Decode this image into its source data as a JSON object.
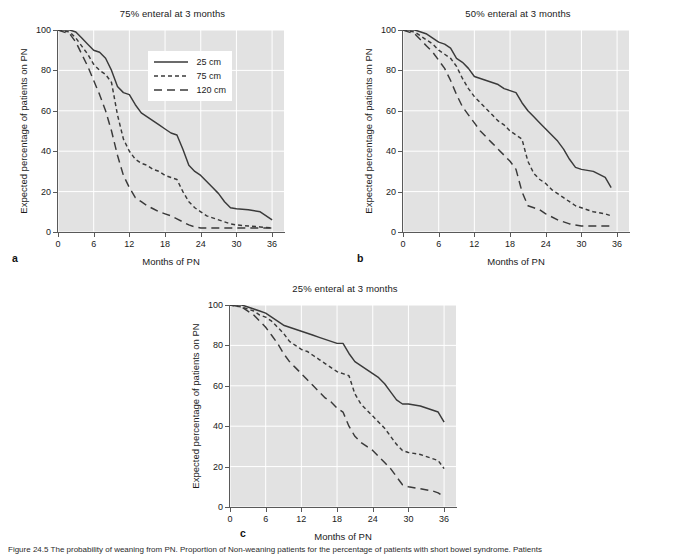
{
  "figure": {
    "caption_prefix": "Figure",
    "caption_text": "Figure 24.5  The probability of weaning from PN. Proportion of Non-weaning patients for the percentage of patients with short bowel syndrome. Patients"
  },
  "axis": {
    "xlabel": "Months of PN",
    "ylabel": "Expected percentage of patients on PN",
    "xticks": [
      0,
      6,
      12,
      18,
      24,
      30,
      36
    ],
    "yticks": [
      0,
      20,
      40,
      60,
      80,
      100
    ],
    "xlim": [
      0,
      38
    ],
    "ylim": [
      0,
      100
    ]
  },
  "legend": {
    "position": "upper-right-inside-panel-a",
    "entries": [
      {
        "label": "25 cm",
        "dash": "solid"
      },
      {
        "label": "75 cm",
        "dash": "short"
      },
      {
        "label": "120 cm",
        "dash": "long"
      }
    ]
  },
  "panels": [
    {
      "letter": "a",
      "title": "75% enteral at 3 months"
    },
    {
      "letter": "b",
      "title": "50% enteral at 3 months"
    },
    {
      "letter": "c",
      "title": "25% enteral at 3 months"
    }
  ],
  "colors": {
    "plot_background": "#e2e2e2",
    "gridline": "#ffffff",
    "axis": "#595959",
    "curve": "#3a3a3a",
    "page_background": "#ffffff",
    "text": "#1a1a1a"
  },
  "chart_data": [
    {
      "type": "line",
      "panel": "a",
      "title": "75% enteral at 3 months",
      "xlabel": "Months of PN",
      "ylabel": "Expected percentage of patients on PN",
      "xlim": [
        0,
        38
      ],
      "ylim": [
        0,
        100
      ],
      "grid": true,
      "legend": [
        "25 cm",
        "75 cm",
        "120 cm"
      ],
      "series": [
        {
          "name": "25 cm",
          "dash": "solid",
          "x": [
            0,
            2,
            3,
            4,
            5,
            6,
            7,
            8,
            9,
            10,
            11,
            12,
            13,
            14,
            15,
            16,
            17,
            18,
            19,
            20,
            21,
            22,
            23,
            24,
            25,
            26,
            27,
            28,
            29,
            30,
            32,
            34,
            36
          ],
          "y": [
            100,
            100,
            99,
            96,
            93,
            90,
            89,
            86,
            80,
            72,
            69,
            68,
            63,
            59,
            57,
            55,
            53,
            51,
            49,
            48,
            41,
            33,
            30,
            28,
            25,
            22,
            19,
            15,
            12,
            11.5,
            11,
            10,
            6
          ]
        },
        {
          "name": "75 cm",
          "dash": "short",
          "x": [
            0,
            2,
            3,
            4,
            5,
            6,
            7,
            8,
            9,
            10,
            11,
            12,
            13,
            14,
            15,
            16,
            17,
            18,
            19,
            20,
            21,
            22,
            23,
            24,
            25,
            26,
            27,
            28,
            29,
            30,
            32,
            34,
            36
          ],
          "y": [
            100,
            99,
            96,
            92,
            88,
            83,
            80,
            78,
            74,
            58,
            46,
            40,
            36,
            34,
            33,
            31,
            30,
            28,
            27,
            26,
            20,
            15,
            12,
            10,
            8,
            7,
            6,
            5,
            4,
            3.5,
            3,
            2.5,
            2
          ]
        },
        {
          "name": "120 cm",
          "dash": "long",
          "x": [
            0,
            2,
            3,
            4,
            5,
            6,
            7,
            8,
            9,
            10,
            11,
            12,
            13,
            14,
            15,
            16,
            17,
            18,
            19,
            20,
            21,
            22,
            23,
            24,
            26,
            28,
            30,
            32,
            34,
            36
          ],
          "y": [
            100,
            98,
            94,
            88,
            82,
            75,
            68,
            60,
            50,
            38,
            28,
            22,
            17,
            15,
            13,
            11.5,
            10,
            9,
            8,
            6.5,
            5,
            3.5,
            2.5,
            2,
            2,
            2,
            2,
            2,
            2,
            2
          ]
        }
      ]
    },
    {
      "type": "line",
      "panel": "b",
      "title": "50% enteral at 3 months",
      "xlabel": "Months of PN",
      "ylabel": "Expected percentage of patients on PN",
      "xlim": [
        0,
        38
      ],
      "ylim": [
        0,
        100
      ],
      "grid": true,
      "legend": [
        "25 cm",
        "75 cm",
        "120 cm"
      ],
      "series": [
        {
          "name": "25 cm",
          "dash": "solid",
          "x": [
            0,
            2,
            3,
            4,
            5,
            6,
            7,
            8,
            9,
            10,
            11,
            12,
            13,
            14,
            15,
            16,
            17,
            18,
            19,
            20,
            21,
            22,
            23,
            24,
            25,
            26,
            27,
            28,
            29,
            30,
            32,
            34,
            35
          ],
          "y": [
            100,
            100,
            99,
            98,
            96,
            94,
            93,
            91,
            86,
            84,
            81,
            77,
            76,
            75,
            74,
            73,
            71,
            70,
            69,
            64,
            60,
            57,
            54,
            51,
            48,
            45,
            41,
            36,
            32,
            31,
            30,
            27,
            22
          ]
        },
        {
          "name": "75 cm",
          "dash": "short",
          "x": [
            0,
            2,
            3,
            4,
            5,
            6,
            7,
            8,
            9,
            10,
            11,
            12,
            13,
            14,
            15,
            16,
            17,
            18,
            19,
            20,
            21,
            22,
            23,
            24,
            25,
            26,
            27,
            28,
            29,
            30,
            32,
            34,
            35
          ],
          "y": [
            100,
            99,
            97,
            95,
            93,
            90,
            88,
            86,
            82,
            76,
            71,
            67,
            64,
            61,
            58,
            55,
            53,
            50,
            48,
            46,
            35,
            29,
            26,
            24,
            21,
            19,
            17,
            15,
            13,
            12,
            10,
            9,
            8
          ]
        },
        {
          "name": "120 cm",
          "dash": "long",
          "x": [
            0,
            2,
            3,
            4,
            5,
            6,
            7,
            8,
            9,
            10,
            11,
            12,
            13,
            14,
            15,
            16,
            17,
            18,
            19,
            20,
            21,
            22,
            23,
            24,
            26,
            28,
            30,
            32,
            34,
            35
          ],
          "y": [
            100,
            98,
            95,
            92,
            89,
            85,
            81,
            75,
            68,
            62,
            58,
            54,
            50,
            47,
            44,
            41,
            38,
            35,
            31,
            20,
            13,
            12,
            11,
            9,
            6,
            4,
            3,
            3,
            3,
            3
          ]
        }
      ]
    },
    {
      "type": "line",
      "panel": "c",
      "title": "25% enteral at 3 months",
      "xlabel": "Months of PN",
      "ylabel": "Expected percentage of patients on PN",
      "xlim": [
        0,
        38
      ],
      "ylim": [
        0,
        100
      ],
      "grid": true,
      "legend": [
        "25 cm",
        "75 cm",
        "120 cm"
      ],
      "series": [
        {
          "name": "25 cm",
          "dash": "solid",
          "x": [
            0,
            2,
            3,
            4,
            5,
            6,
            7,
            8,
            9,
            10,
            11,
            12,
            13,
            14,
            15,
            16,
            17,
            18,
            19,
            20,
            21,
            22,
            23,
            24,
            25,
            26,
            27,
            28,
            29,
            30,
            32,
            34,
            35,
            36
          ],
          "y": [
            100,
            100,
            99,
            98,
            97,
            96,
            94,
            92,
            90,
            89,
            88,
            87,
            86,
            85,
            84,
            83,
            82,
            81,
            81,
            76,
            72,
            70,
            68,
            66,
            64,
            61,
            57,
            53,
            51,
            51,
            50,
            48,
            47,
            42
          ]
        },
        {
          "name": "75 cm",
          "dash": "short",
          "x": [
            0,
            2,
            3,
            4,
            5,
            6,
            7,
            8,
            9,
            10,
            11,
            12,
            13,
            14,
            15,
            16,
            17,
            18,
            19,
            20,
            21,
            22,
            23,
            24,
            25,
            26,
            27,
            28,
            29,
            30,
            32,
            34,
            35,
            36
          ],
          "y": [
            100,
            99,
            98,
            97,
            95,
            94,
            92,
            89,
            86,
            82,
            80,
            78,
            77,
            75,
            73,
            71,
            69,
            67,
            66,
            65,
            56,
            51,
            48,
            45,
            42,
            39,
            35,
            31,
            28,
            27,
            26,
            24,
            23,
            19
          ]
        },
        {
          "name": "120 cm",
          "dash": "long",
          "x": [
            0,
            2,
            3,
            4,
            5,
            6,
            7,
            8,
            9,
            10,
            11,
            12,
            13,
            14,
            15,
            16,
            17,
            18,
            19,
            20,
            21,
            22,
            23,
            24,
            25,
            26,
            27,
            28,
            29,
            30,
            32,
            34,
            35,
            36
          ],
          "y": [
            100,
            99,
            97,
            95,
            92,
            89,
            85,
            81,
            76,
            72,
            69,
            66,
            63,
            60,
            57,
            54,
            52,
            49,
            47,
            40,
            35,
            32,
            30,
            28,
            25,
            22,
            19,
            15,
            11,
            10,
            9,
            8,
            7,
            5
          ]
        }
      ]
    }
  ]
}
